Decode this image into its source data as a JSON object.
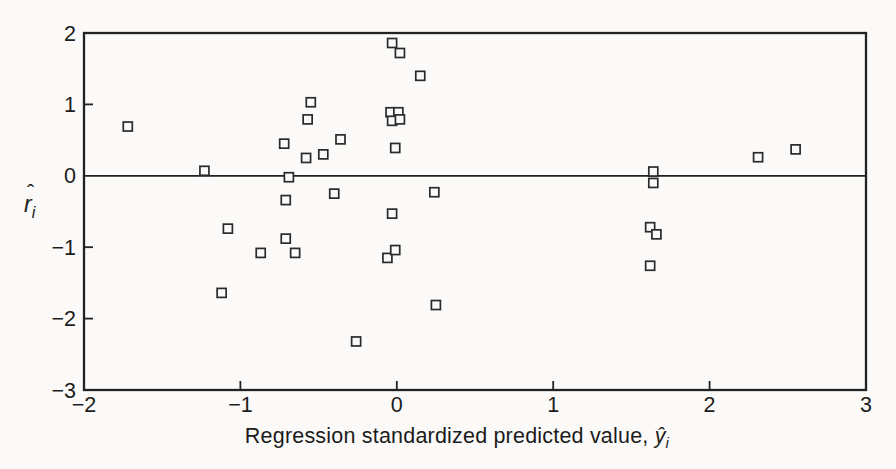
{
  "chart_data": {
    "type": "scatter",
    "marker_shape": "open-square",
    "title": "",
    "xlabel_text": "Regression standardized predicted value, ",
    "xlabel_symbol": "ŷ",
    "xlabel_subscript": "i",
    "ylabel_symbol": "r",
    "ylabel_hat": "ˆ",
    "ylabel_subscript": "i",
    "xlim": [
      -2,
      3
    ],
    "ylim": [
      -3,
      2
    ],
    "grid": false,
    "zero_line_y": 0,
    "x_ticks": [
      {
        "v": -2,
        "label": "−2"
      },
      {
        "v": -1,
        "label": "−1"
      },
      {
        "v": 0,
        "label": "0"
      },
      {
        "v": 1,
        "label": "1"
      },
      {
        "v": 2,
        "label": "2"
      },
      {
        "v": 3,
        "label": "3"
      }
    ],
    "y_ticks": [
      {
        "v": 2,
        "label": "2"
      },
      {
        "v": 1,
        "label": "1"
      },
      {
        "v": 0,
        "label": "0"
      },
      {
        "v": -1,
        "label": "−1"
      },
      {
        "v": -2,
        "label": "−2"
      },
      {
        "v": -3,
        "label": "−3"
      }
    ],
    "points": [
      {
        "x": -1.72,
        "y": 0.69
      },
      {
        "x": -1.23,
        "y": 0.07
      },
      {
        "x": -1.08,
        "y": -0.74
      },
      {
        "x": -1.12,
        "y": -1.64
      },
      {
        "x": -0.87,
        "y": -1.08
      },
      {
        "x": -0.72,
        "y": 0.45
      },
      {
        "x": -0.69,
        "y": -0.02
      },
      {
        "x": -0.71,
        "y": -0.34
      },
      {
        "x": -0.71,
        "y": -0.88
      },
      {
        "x": -0.65,
        "y": -1.08
      },
      {
        "x": -0.57,
        "y": 0.79
      },
      {
        "x": -0.55,
        "y": 1.03
      },
      {
        "x": -0.58,
        "y": 0.25
      },
      {
        "x": -0.47,
        "y": 0.3
      },
      {
        "x": -0.36,
        "y": 0.51
      },
      {
        "x": -0.4,
        "y": -0.25
      },
      {
        "x": -0.26,
        "y": -2.32
      },
      {
        "x": -0.06,
        "y": -1.15
      },
      {
        "x": -0.01,
        "y": -1.04
      },
      {
        "x": -0.03,
        "y": -0.53
      },
      {
        "x": -0.01,
        "y": 0.39
      },
      {
        "x": -0.04,
        "y": 0.89
      },
      {
        "x": 0.01,
        "y": 0.89
      },
      {
        "x": -0.03,
        "y": 0.77
      },
      {
        "x": 0.02,
        "y": 0.79
      },
      {
        "x": -0.03,
        "y": 1.86
      },
      {
        "x": 0.02,
        "y": 1.72
      },
      {
        "x": 0.15,
        "y": 1.4
      },
      {
        "x": 0.24,
        "y": -0.23
      },
      {
        "x": 0.25,
        "y": -1.81
      },
      {
        "x": 1.64,
        "y": 0.06
      },
      {
        "x": 1.64,
        "y": -0.1
      },
      {
        "x": 1.62,
        "y": -0.72
      },
      {
        "x": 1.66,
        "y": -0.82
      },
      {
        "x": 1.62,
        "y": -1.26
      },
      {
        "x": 2.31,
        "y": 0.26
      },
      {
        "x": 2.55,
        "y": 0.37
      }
    ],
    "colors": {
      "ink": "#222222",
      "paper": "#fbfaf8",
      "marker_fill": "#fbfaf8"
    }
  }
}
